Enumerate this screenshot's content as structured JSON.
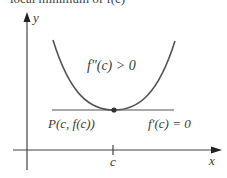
{
  "figure": {
    "caption_clipped": "local minimum of f(c)",
    "axes": {
      "x_label": "x",
      "y_label": "y"
    },
    "curve": {
      "type": "concave-up parabola",
      "label": "f″(c) > 0"
    },
    "point": {
      "label": "P(c, f(c))"
    },
    "tangent": {
      "label": "f′(c) = 0"
    },
    "x_tick": {
      "label": "c"
    },
    "colors": {
      "curve": "#555555",
      "axes": "#444444",
      "text": "#3a3a3a",
      "point": "#333333"
    }
  }
}
